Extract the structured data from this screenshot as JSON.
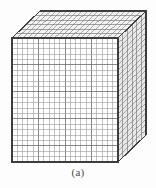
{
  "figure": {
    "caption": "(a)",
    "projection": "oblique",
    "canvas": {
      "width": 156,
      "height": 188
    },
    "colors": {
      "background": "#fdfdfd",
      "grid_line": "#6b6b6b",
      "grid_line_light": "#9a9a9a",
      "outline": "#3d3d3d",
      "front_face_fill": "#ffffff",
      "top_face_fill": "#f2f2f2",
      "side_face_fill": "#e8e8e8",
      "caption_text": "#4a4a4a"
    },
    "geometry": {
      "front_left": 12,
      "front_top": 38,
      "front_width": 106,
      "front_height": 124,
      "depth_dx": 28,
      "depth_dy": -27,
      "columns": 20,
      "rows": 23,
      "depth_layers": 6
    }
  }
}
